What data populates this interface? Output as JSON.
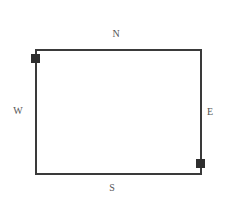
{
  "diagram": {
    "type": "rectangle-room-with-compass-labels",
    "labels": {
      "north": "N",
      "south": "S",
      "east": "E",
      "west": "W"
    },
    "markers": [
      {
        "position": "top-left corner (north-west)",
        "shape": "filled-square"
      },
      {
        "position": "bottom-right corner (south-east)",
        "shape": "filled-square"
      }
    ],
    "colors": {
      "outline": "#3a3a3a",
      "marker": "#2e2e2e",
      "label": "#555555",
      "background": "#ffffff"
    }
  }
}
